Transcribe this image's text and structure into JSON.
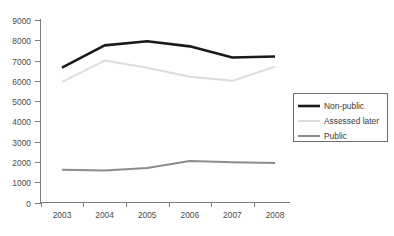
{
  "chart_data": {
    "type": "line",
    "title": "",
    "subtitle": "",
    "xlabel": "",
    "ylabel": "",
    "categories": [
      "2003",
      "2004",
      "2005",
      "2006",
      "2007",
      "2008"
    ],
    "x": [
      2003,
      2004,
      2005,
      2006,
      2007,
      2008
    ],
    "ylim": [
      0,
      9000
    ],
    "yticks": [
      0,
      1000,
      2000,
      3000,
      4000,
      5000,
      6000,
      7000,
      8000,
      9000
    ],
    "ytick_labels": [
      "0",
      "1000",
      "2000",
      "3000",
      "4000",
      "5000",
      "6000",
      "7000",
      "8000",
      "9000"
    ],
    "grid": false,
    "legend_position": "right",
    "series": [
      {
        "name": "Non-public",
        "color": "#1a1a1a",
        "stroke_width": 2.6,
        "values": [
          6650,
          7750,
          7950,
          7700,
          7150,
          7200
        ]
      },
      {
        "name": "Assessed later",
        "color": "#dcdcdc",
        "stroke_width": 2.0,
        "values": [
          5950,
          7000,
          6650,
          6200,
          6000,
          6700
        ]
      },
      {
        "name": "Public",
        "color": "#8d8d8d",
        "stroke_width": 2.0,
        "values": [
          1620,
          1580,
          1700,
          2050,
          1980,
          1950
        ]
      }
    ]
  },
  "legend": {
    "entries": [
      {
        "label": "Non-public"
      },
      {
        "label": "Assessed later"
      },
      {
        "label": "Public"
      }
    ]
  },
  "axes": {
    "y_tick_labels": [
      "9000",
      "8000",
      "7000",
      "6000",
      "5000",
      "4000",
      "3000",
      "2000",
      "1000",
      "0"
    ],
    "x_tick_labels": [
      "2003",
      "2004",
      "2005",
      "2006",
      "2007",
      "2008"
    ]
  },
  "colors": {
    "axis": "#7d7d7d",
    "text": "#3a3a3a",
    "background": "#ffffff",
    "non_public": "#1a1a1a",
    "assessed_later": "#dcdcdc",
    "public": "#8d8d8d"
  }
}
